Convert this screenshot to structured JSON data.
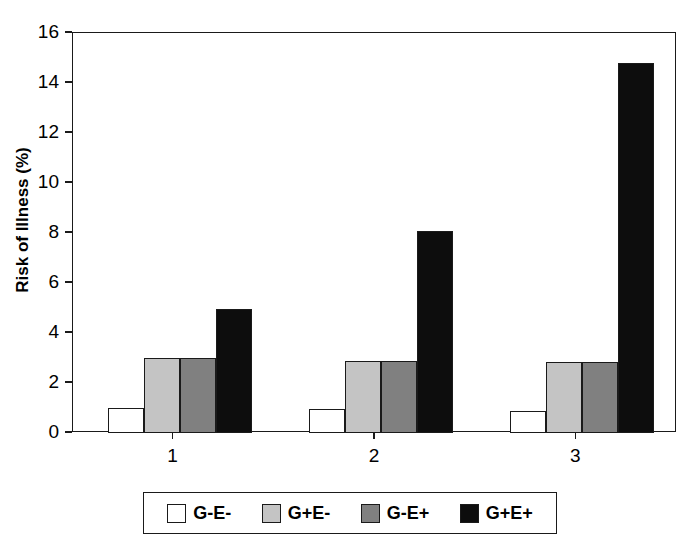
{
  "chart_data": {
    "type": "bar",
    "title": "",
    "xlabel": "",
    "ylabel": "Risk of Illness (%)",
    "categories": [
      "1",
      "2",
      "3"
    ],
    "ylim": [
      0,
      16
    ],
    "yticks": [
      0,
      2,
      4,
      6,
      8,
      10,
      12,
      14,
      16
    ],
    "ytick_labels": [
      "0",
      "2",
      "4",
      "6",
      "8",
      "10",
      "12",
      "14",
      "16"
    ],
    "grid": false,
    "legend_position": "bottom",
    "series": [
      {
        "name": "G-E-",
        "color": "#ffffff",
        "values": [
          1.0,
          0.95,
          0.9
        ]
      },
      {
        "name": "G+E-",
        "color": "#c4c4c4",
        "values": [
          3.0,
          2.9,
          2.85
        ]
      },
      {
        "name": "G-E+",
        "color": "#808080",
        "values": [
          3.0,
          2.9,
          2.85
        ]
      },
      {
        "name": "G+E+",
        "color": "#0d0d0d",
        "values": [
          4.95,
          8.1,
          14.8
        ]
      }
    ]
  },
  "axis": {
    "y_title": "Risk of Illness (%)"
  },
  "legend": {
    "entries": [
      {
        "label": "G-E-"
      },
      {
        "label": "G+E-"
      },
      {
        "label": "G-E+"
      },
      {
        "label": "G+E+"
      }
    ]
  }
}
